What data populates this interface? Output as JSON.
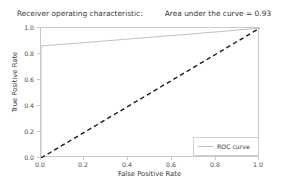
{
  "chart_data": {
    "type": "line",
    "title": "Receiver operating characteristic:",
    "title_right": "Area under the curve = 0.93",
    "auc": 0.93,
    "xlabel": "False Positive Rate",
    "ylabel": "True Positive Rate",
    "xlim": [
      0.0,
      1.0
    ],
    "ylim": [
      0.0,
      1.0
    ],
    "grid": false,
    "legend_position": "lower right",
    "xticks": [
      "0.0",
      "0.2",
      "0.4",
      "0.6",
      "0.8",
      "1.0"
    ],
    "xtick_values": [
      0.0,
      0.2,
      0.4,
      0.6,
      0.8,
      1.0
    ],
    "yticks": [
      "0.0",
      "0.2",
      "0.4",
      "0.6",
      "0.8",
      "1.0"
    ],
    "ytick_values": [
      0.0,
      0.2,
      0.4,
      0.6,
      0.8,
      1.0
    ],
    "series": [
      {
        "name": "ROC curve",
        "color": "#c0c0c0",
        "linestyle": "solid",
        "x": [
          0.0,
          0.0,
          0.2,
          0.4,
          0.6,
          0.8,
          1.0
        ],
        "y": [
          0.0,
          0.862,
          0.888,
          0.915,
          0.942,
          0.97,
          1.0
        ]
      },
      {
        "name": "chance-diagonal",
        "color": "#1a1a1a",
        "linestyle": "dashed",
        "x": [
          0.0,
          1.0
        ],
        "y": [
          0.0,
          1.0
        ]
      }
    ]
  },
  "legend": {
    "entries": [
      {
        "label": "ROC curve",
        "color": "#c0c0c0"
      }
    ]
  },
  "colors": {
    "roc_line": "#c0c0c0",
    "diagonal": "#1a1a1a",
    "spine": "#c9c9c9",
    "text": "#3a3a3a",
    "background": "#ffffff"
  }
}
